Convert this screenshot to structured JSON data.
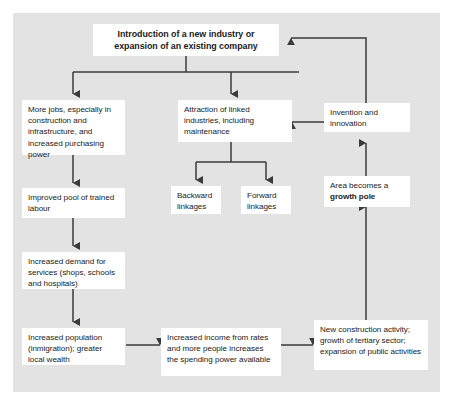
{
  "diagram": {
    "title": "Introduction of a new industry or expansion of an existing company",
    "nodes": {
      "title_box": {
        "label": "Introduction of a new industry or expansion of an existing company"
      },
      "more_jobs": {
        "label": "More jobs, especially in construction and infrastructure, and increased purchasing power"
      },
      "improved_pool": {
        "label": "Improved pool of trained labour"
      },
      "increased_demand": {
        "label": "Increased demand for services (shops, schools and hospitals)"
      },
      "increased_population": {
        "label": "Increased population (inmigration); greater local wealth"
      },
      "attraction_linked": {
        "label": "Attraction of linked industries, including maintenance"
      },
      "backward_linkages": {
        "label": "Backward linkages"
      },
      "forward_linkages": {
        "label": "Forward linkages"
      },
      "invention": {
        "label": "Invention and innovation"
      },
      "growth_pole": {
        "label_prefix": "Area becomes a ",
        "label_bold": "growth pole"
      },
      "increased_income": {
        "label": "Increased income from rates and more people increases the spending power available"
      },
      "new_construction": {
        "label": "New construction activity; growth of tertiary sector; expansion of public activities"
      }
    },
    "colors": {
      "panel_background": "#e3e3e3",
      "node_background": "#ffffff",
      "connector": "#3a3a3a",
      "text": "#1b1b1b",
      "page_background": "#ffffff"
    },
    "edges": [
      {
        "from": "title_box",
        "to": "more_jobs"
      },
      {
        "from": "title_box",
        "to": "attraction_linked"
      },
      {
        "from": "more_jobs",
        "to": "improved_pool"
      },
      {
        "from": "improved_pool",
        "to": "increased_demand"
      },
      {
        "from": "increased_demand",
        "to": "increased_population"
      },
      {
        "from": "attraction_linked",
        "to": "backward_linkages"
      },
      {
        "from": "attraction_linked",
        "to": "forward_linkages"
      },
      {
        "from": "increased_population",
        "to": "increased_income"
      },
      {
        "from": "increased_income",
        "to": "new_construction"
      },
      {
        "from": "new_construction",
        "to": "growth_pole"
      },
      {
        "from": "growth_pole",
        "to": "invention"
      },
      {
        "from": "invention",
        "to": "attraction_linked"
      },
      {
        "from": "invention",
        "to": "title_box"
      }
    ]
  }
}
